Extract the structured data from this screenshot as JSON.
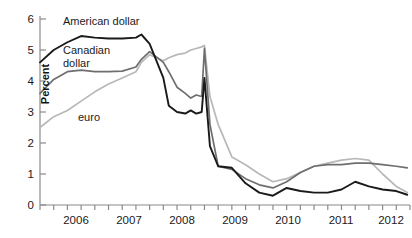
{
  "chart_data": {
    "type": "line",
    "title": "",
    "xlabel": "",
    "ylabel": "Percent",
    "ylim": [
      0,
      6
    ],
    "yticks": [
      0,
      1,
      2,
      3,
      4,
      5,
      6
    ],
    "ytick_labels": [
      "0",
      "1",
      "2",
      "3",
      "4",
      "5",
      "6"
    ],
    "xlim": [
      2005.75,
      2012.5
    ],
    "xtick_labels": [
      "2006",
      "2007",
      "2008",
      "2009",
      "2010",
      "2011",
      "2012"
    ],
    "xtick_positions": [
      2006,
      2007,
      2008,
      2009,
      2010,
      2011,
      2012
    ],
    "minor_tick_interval_years": 0.25,
    "grid": false,
    "legend": "inline-annotations",
    "x": [
      2005.75,
      2006.0,
      2006.25,
      2006.5,
      2006.75,
      2007.0,
      2007.25,
      2007.5,
      2007.6,
      2007.75,
      2008.0,
      2008.1,
      2008.25,
      2008.4,
      2008.5,
      2008.6,
      2008.7,
      2008.75,
      2008.85,
      2009.0,
      2009.25,
      2009.5,
      2009.75,
      2010.0,
      2010.25,
      2010.5,
      2010.75,
      2011.0,
      2011.25,
      2011.5,
      2011.75,
      2012.0,
      2012.25,
      2012.45
    ],
    "series": [
      {
        "name": "American dollar",
        "color": "#1a1a1a",
        "values": [
          4.6,
          5.0,
          5.25,
          5.45,
          5.4,
          5.37,
          5.37,
          5.4,
          5.5,
          5.2,
          4.1,
          3.2,
          3.0,
          2.95,
          3.05,
          2.95,
          3.0,
          4.1,
          1.9,
          1.25,
          1.2,
          0.7,
          0.4,
          0.3,
          0.55,
          0.45,
          0.4,
          0.4,
          0.5,
          0.75,
          0.6,
          0.5,
          0.45,
          0.33
        ]
      },
      {
        "name": "Canadian dollar",
        "color": "#6e6e6e",
        "values": [
          3.6,
          4.05,
          4.3,
          4.35,
          4.3,
          4.3,
          4.32,
          4.45,
          4.7,
          4.95,
          4.6,
          4.3,
          3.8,
          3.6,
          3.45,
          3.55,
          3.5,
          5.05,
          2.6,
          1.25,
          1.15,
          0.85,
          0.65,
          0.55,
          0.75,
          1.05,
          1.25,
          1.3,
          1.3,
          1.35,
          1.35,
          1.3,
          1.25,
          1.2
        ]
      },
      {
        "name": "euro",
        "color": "#b8b8b8",
        "values": [
          2.5,
          2.85,
          3.05,
          3.35,
          3.65,
          3.9,
          4.1,
          4.3,
          4.6,
          4.85,
          4.65,
          4.75,
          4.85,
          4.9,
          5.0,
          5.05,
          5.1,
          5.15,
          3.5,
          2.6,
          1.55,
          1.3,
          1.0,
          0.75,
          0.85,
          1.05,
          1.25,
          1.35,
          1.45,
          1.5,
          1.45,
          1.0,
          0.6,
          0.4
        ]
      }
    ],
    "annotations": [
      {
        "text": "American dollar",
        "series": "American dollar"
      },
      {
        "text": "Canadian\ndollar",
        "series": "Canadian dollar"
      },
      {
        "text": "euro",
        "series": "euro"
      }
    ]
  },
  "axis": {
    "y_label": "Percent",
    "y_tick_labels": [
      "6",
      "5",
      "4",
      "3",
      "2",
      "1",
      "0"
    ],
    "x_tick_labels": [
      "2006",
      "2007",
      "2008",
      "2009",
      "2010",
      "2011",
      "2012"
    ]
  },
  "labels": {
    "american_dollar": "American dollar",
    "canadian_dollar": "Canadian\ndollar",
    "euro": "euro"
  }
}
